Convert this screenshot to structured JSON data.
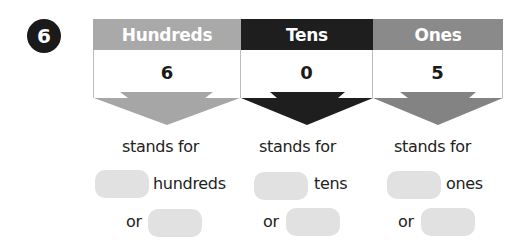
{
  "question": {
    "number": "6"
  },
  "table": {
    "columns": [
      {
        "header": "Hundreds",
        "value": "6",
        "header_color": "#a9a9a9",
        "arrow_color": "#a6a6a6"
      },
      {
        "header": "Tens",
        "value": "0",
        "header_color": "#1e1e1e",
        "arrow_color": "#1e1e1e"
      },
      {
        "header": "Ones",
        "value": "5",
        "header_color": "#8a8a8a",
        "arrow_color": "#838383"
      }
    ]
  },
  "answers": [
    {
      "stands_for": "stands for",
      "unit": "hundreds",
      "or": "or",
      "blank_units": "",
      "blank_value": ""
    },
    {
      "stands_for": "stands for",
      "unit": "tens",
      "or": "or",
      "blank_units": "",
      "blank_value": ""
    },
    {
      "stands_for": "stands for",
      "unit": "ones",
      "or": "or",
      "blank_units": "",
      "blank_value": ""
    }
  ]
}
